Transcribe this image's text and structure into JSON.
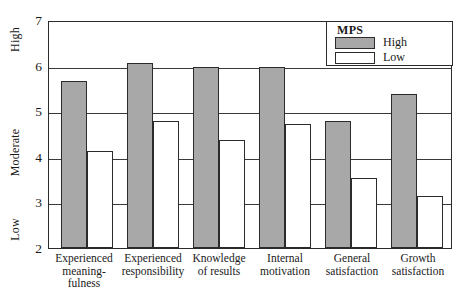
{
  "chart_data": {
    "type": "bar",
    "title": "",
    "xlabel": "",
    "ylabel": "",
    "ylim": [
      2,
      7
    ],
    "yticks": [
      2,
      3,
      4,
      5,
      6,
      7
    ],
    "grid": true,
    "legend_position": "top-right",
    "legend_title": "MPS",
    "axis_categories": [
      {
        "label": "High",
        "position": 6.7
      },
      {
        "label": "Moderate",
        "position": 4.3
      },
      {
        "label": "Low",
        "position": 2.5
      }
    ],
    "categories": [
      "Experienced meaning-fulness",
      "Experienced responsibility",
      "Knowledge of results",
      "Internal motivation",
      "General satisfaction",
      "Growth satisfaction"
    ],
    "category_lines": [
      [
        "Experienced",
        "meaning-",
        "fulness"
      ],
      [
        "Experienced",
        "responsibility"
      ],
      [
        "Knowledge",
        "of results"
      ],
      [
        "Internal",
        "motivation"
      ],
      [
        "General",
        "satisfaction"
      ],
      [
        "Growth",
        "satisfaction"
      ]
    ],
    "series": [
      {
        "name": "High",
        "color": "#a8a8a8",
        "values": [
          5.7,
          6.1,
          6.0,
          6.0,
          4.8,
          5.4
        ]
      },
      {
        "name": "Low",
        "color": "#ffffff",
        "values": [
          4.15,
          4.8,
          4.4,
          4.75,
          3.55,
          3.15
        ]
      }
    ]
  },
  "colors": {
    "high_fill": "#a8a8a8",
    "low_fill": "#ffffff",
    "stroke": "#2b2b2b",
    "grid": "#3a3a3a",
    "background": "#ffffff"
  }
}
